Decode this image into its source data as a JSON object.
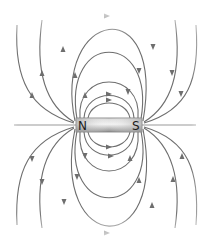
{
  "diagram": {
    "magnet": {
      "north_label": "N",
      "south_label": "S",
      "fill_colors": [
        "#9c9c9c",
        "#e4e4e4",
        "#8e8e8e"
      ]
    },
    "field_line_color": "#6e6e6e",
    "direction": "N to S outside magnet",
    "closed_loops_per_side": 5,
    "open_lines_per_side": 2
  }
}
